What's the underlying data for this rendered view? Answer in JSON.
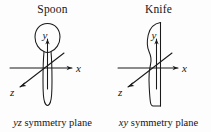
{
  "figure": {
    "background_color": "#fdfdfd",
    "line_color": "#1a1a1a",
    "panels": [
      {
        "id": "spoon",
        "title": "Spoon",
        "object_name": "spoon-outline",
        "caption_italic": "yz",
        "caption_rest": " symmetry plane",
        "caption_full": "yz symmetry plane",
        "axes": {
          "x_label": "x",
          "y_label": "y",
          "z_label": "z"
        }
      },
      {
        "id": "knife",
        "title": "Knife",
        "object_name": "knife-outline",
        "caption_italic": "xy",
        "caption_rest": " symmetry plane",
        "caption_full": "xy symmetry plane",
        "axes": {
          "x_label": "x",
          "y_label": "y",
          "z_label": "z"
        }
      }
    ]
  }
}
